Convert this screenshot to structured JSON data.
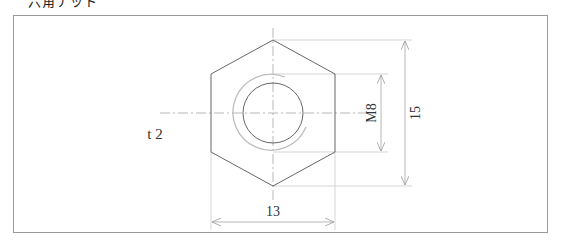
{
  "header": {
    "label": "六角ナット"
  },
  "drawing": {
    "thickness_label": "t 2",
    "dimensions": {
      "width_across_flats": "13",
      "width_across_corners": "15",
      "thread": "M8"
    },
    "colors": {
      "outline": "#555555",
      "center_line": "#999999",
      "dimension_line": "#b0b0b0",
      "thread_arc": "#bdbdbd",
      "frame": "#9a9a9a"
    }
  }
}
